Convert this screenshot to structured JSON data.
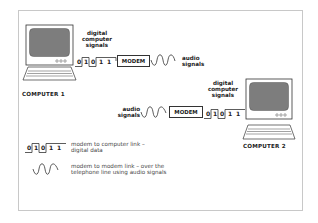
{
  "diagram": {
    "computer1": {
      "label": "COMPUTER 1"
    },
    "computer2": {
      "label": "COMPUTER 2"
    },
    "row1": {
      "digital_label": [
        "digital",
        "computer",
        "signals"
      ],
      "bits": [
        "0",
        "1",
        "0",
        "1",
        "1"
      ],
      "modem_label": "MODEM",
      "audio_label": [
        "audio",
        "signals"
      ]
    },
    "row2": {
      "audio_label": [
        "audio",
        "signals"
      ],
      "modem_label": "MODEM",
      "bits": [
        "0",
        "1",
        "0",
        "1",
        "1"
      ],
      "digital_label": [
        "digital",
        "computer",
        "signals"
      ]
    },
    "legend": {
      "digital": {
        "bits": [
          "0",
          "1",
          "0",
          "1",
          "1"
        ],
        "text": [
          "modem to computer link –",
          "digital  data"
        ]
      },
      "audio": {
        "text": [
          "modem to modem link – over the",
          "telephone line using audio signals"
        ]
      }
    },
    "colors": {
      "screen": "#7d7d7d",
      "line": "#333333",
      "frame": "#c8c8c8"
    }
  }
}
